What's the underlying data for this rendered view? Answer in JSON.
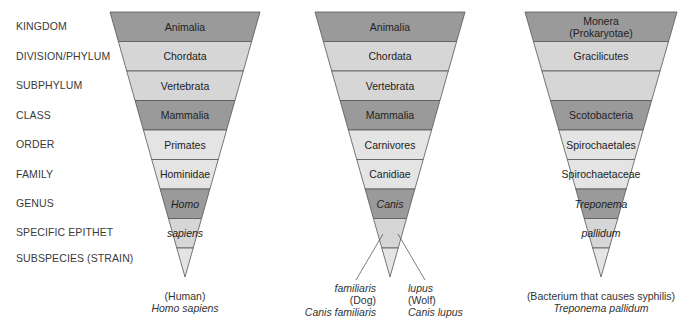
{
  "ranks": [
    "KINGDOM",
    "DIVISION/PHYLUM",
    "SUBPHYLUM",
    "CLASS",
    "ORDER",
    "FAMILY",
    "GENUS",
    "SPECIFIC EPITHET",
    "SUBSPECIES (STRAIN)"
  ],
  "colors": {
    "dark": "#9a9a9a",
    "mid": "#bdbdbd",
    "light": "#d6d6d6",
    "lighter": "#e4e4e4",
    "outline": "#555555"
  },
  "funnels": [
    {
      "name": "human",
      "bands": [
        {
          "label": "Animalia",
          "italic": false,
          "shade": "dark"
        },
        {
          "label": "Chordata",
          "italic": false,
          "shade": "light"
        },
        {
          "label": "Vertebrata",
          "italic": false,
          "shade": "light"
        },
        {
          "label": "Mammalia",
          "italic": false,
          "shade": "dark"
        },
        {
          "label": "Primates",
          "italic": false,
          "shade": "lighter"
        },
        {
          "label": "Hominidae",
          "italic": false,
          "shade": "lighter"
        },
        {
          "label": "Homo",
          "italic": true,
          "shade": "dark"
        },
        {
          "label": "sapiens",
          "italic": true,
          "shade": "light"
        },
        {
          "label": "",
          "italic": false,
          "shade": "lighter"
        }
      ],
      "caption": {
        "common": "(Human)",
        "scientific": "Homo sapiens"
      }
    },
    {
      "name": "dog-wolf",
      "bands": [
        {
          "label": "Animalia",
          "italic": false,
          "shade": "dark"
        },
        {
          "label": "Chordata",
          "italic": false,
          "shade": "light"
        },
        {
          "label": "Vertebrata",
          "italic": false,
          "shade": "light"
        },
        {
          "label": "Mammalia",
          "italic": false,
          "shade": "dark"
        },
        {
          "label": "Carnivores",
          "italic": false,
          "shade": "lighter"
        },
        {
          "label": "Canidiae",
          "italic": false,
          "shade": "lighter"
        },
        {
          "label": "Canis",
          "italic": true,
          "shade": "dark"
        },
        {
          "label": "",
          "italic": false,
          "shade": "light"
        },
        {
          "label": "",
          "italic": false,
          "shade": "lighter"
        }
      ],
      "captions": [
        {
          "epithet": "familiaris",
          "common": "(Dog)",
          "scientific": "Canis familiaris"
        },
        {
          "epithet": "lupus",
          "common": "(Wolf)",
          "scientific": "Canis lupus"
        }
      ]
    },
    {
      "name": "syphilis-bacterium",
      "bands": [
        {
          "label": "Monera",
          "label2": "(Prokaryotae)",
          "italic": false,
          "shade": "dark"
        },
        {
          "label": "Gracilicutes",
          "italic": false,
          "shade": "light"
        },
        {
          "label": "",
          "italic": false,
          "shade": "light"
        },
        {
          "label": "Scotobacteria",
          "italic": false,
          "shade": "dark"
        },
        {
          "label": "Spirochaetales",
          "italic": false,
          "shade": "lighter"
        },
        {
          "label": "Spirochaetaceae",
          "italic": false,
          "shade": "lighter"
        },
        {
          "label": "Treponema",
          "italic": true,
          "shade": "dark"
        },
        {
          "label": "pallidum",
          "italic": true,
          "shade": "light"
        },
        {
          "label": "",
          "italic": false,
          "shade": "lighter"
        }
      ],
      "caption": {
        "common": "(Bacterium that causes syphilis)",
        "scientific": "Treponema pallidum"
      }
    }
  ]
}
